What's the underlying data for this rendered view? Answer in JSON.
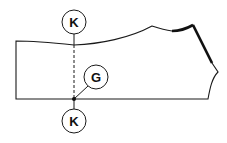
{
  "diagram": {
    "labels": {
      "k_top": "K",
      "g": "G",
      "k_bottom": "K"
    },
    "colors": {
      "stroke": "#1a1a1a",
      "background": "#ffffff"
    }
  }
}
